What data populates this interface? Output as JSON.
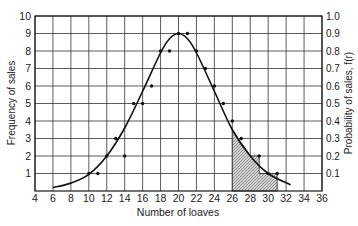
{
  "chart_data": {
    "type": "scatter",
    "title": "",
    "xlabel": "Number of loaves",
    "ylabel": "Frequency of sales",
    "y2label": "Probability of sales, f(r)",
    "xlim": [
      4,
      36
    ],
    "ylim": [
      0,
      10
    ],
    "y2lim": [
      0,
      1.0
    ],
    "grid": true,
    "x_ticks": [
      4,
      6,
      8,
      10,
      12,
      14,
      16,
      18,
      20,
      22,
      24,
      26,
      28,
      30,
      32,
      34,
      36
    ],
    "y_ticks": [
      1,
      2,
      3,
      4,
      5,
      6,
      7,
      8,
      9,
      10
    ],
    "y2_ticks": [
      "0.1",
      "0.2",
      "0.3",
      "0.4",
      "0.5",
      "0.6",
      "0.7",
      "0.8",
      "0.9",
      "1.0"
    ],
    "series": [
      {
        "name": "Observed sales frequency",
        "kind": "points",
        "x": [
          10,
          11,
          12,
          13,
          14,
          15,
          16,
          17,
          18,
          19,
          20,
          21,
          22,
          23,
          24,
          25,
          26,
          27,
          29,
          30,
          31
        ],
        "y": [
          1,
          1,
          2,
          3,
          2,
          5,
          5,
          6,
          8,
          8,
          9,
          9,
          8,
          7,
          6,
          5,
          4,
          3,
          2,
          1,
          1
        ]
      },
      {
        "name": "Fitted distribution curve",
        "kind": "line",
        "x": [
          6,
          8,
          10,
          12,
          14,
          16,
          18,
          19,
          20,
          21,
          22,
          24,
          26,
          28,
          30,
          32.5
        ],
        "y": [
          0.2,
          0.45,
          0.95,
          2.0,
          3.6,
          5.7,
          7.9,
          8.7,
          9.0,
          8.7,
          7.9,
          5.7,
          3.5,
          2.0,
          1.0,
          0.35
        ]
      }
    ],
    "shaded_region": {
      "description": "Hatched area under curve / steps for sales of 26 loaves or more",
      "steps": [
        {
          "x0": 26,
          "x1": 28,
          "top": "curve"
        },
        {
          "x0": 28,
          "x1": 29,
          "top": 2
        },
        {
          "x0": 29,
          "x1": 31,
          "top": 1
        }
      ]
    }
  }
}
